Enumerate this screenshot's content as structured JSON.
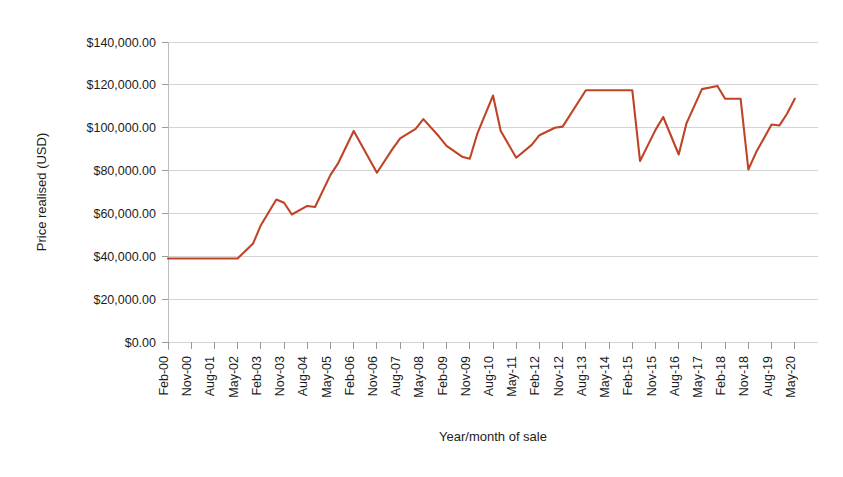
{
  "chart_data": {
    "type": "line",
    "title": "",
    "xlabel": "Year/month of sale",
    "ylabel": "Price realised (USD)",
    "ylim": [
      0,
      140000
    ],
    "ytick_values": [
      0,
      20000,
      40000,
      60000,
      80000,
      100000,
      120000,
      140000
    ],
    "ytick_labels": [
      "$0.00",
      "$20,000.00",
      "$40,000.00",
      "$60,000.00",
      "$80,000.00",
      "$100,000.00",
      "$120,000.00",
      "$140,000.00"
    ],
    "xtick_labels": [
      "Feb-00",
      "Nov-00",
      "Aug-01",
      "May-02",
      "Feb-03",
      "Nov-03",
      "Aug-04",
      "May-05",
      "Feb-06",
      "Nov-06",
      "Aug-07",
      "May-08",
      "Feb-09",
      "Nov-09",
      "Aug-10",
      "May-11",
      "Feb-12",
      "Nov-12",
      "Aug-13",
      "May-14",
      "Feb-15",
      "Nov-15",
      "Aug-16",
      "May-17",
      "Feb-18",
      "Nov-18",
      "Aug-19",
      "May-20"
    ],
    "xtick_interval_months": 9,
    "grid": true,
    "legend": "none",
    "line_color": "#bf4427",
    "series": [
      {
        "name": "Price realised",
        "x": [
          "Feb-00",
          "Nov-00",
          "Aug-01",
          "May-02",
          "Nov-02",
          "Feb-03",
          "Aug-03",
          "Nov-03",
          "Feb-04",
          "Aug-04",
          "Nov-04",
          "May-05",
          "Aug-05",
          "Feb-06",
          "Nov-06",
          "May-07",
          "Aug-07",
          "Feb-08",
          "May-08",
          "Nov-08",
          "Feb-09",
          "Aug-09",
          "Nov-09",
          "Feb-10",
          "Aug-10",
          "Nov-10",
          "May-11",
          "Nov-11",
          "Feb-12",
          "Aug-12",
          "Nov-12",
          "Aug-13",
          "Feb-15",
          "May-15",
          "Nov-15",
          "Feb-16",
          "Aug-16",
          "Nov-16",
          "May-17",
          "Nov-17",
          "Feb-18",
          "Aug-18",
          "Nov-18",
          "Feb-19",
          "Aug-19",
          "Nov-19",
          "Feb-20",
          "May-20"
        ],
        "values": [
          39000,
          39000,
          39000,
          39000,
          46000,
          54500,
          66500,
          65000,
          59500,
          63500,
          63000,
          78000,
          83500,
          98500,
          79000,
          90000,
          95000,
          99500,
          104000,
          96000,
          91500,
          86500,
          85500,
          97500,
          115000,
          98500,
          86000,
          92000,
          96500,
          100000,
          100500,
          117500,
          117500,
          84500,
          99000,
          105000,
          87500,
          102000,
          118000,
          119500,
          113500,
          113500,
          80500,
          88500,
          101500,
          101000,
          106500,
          113500
        ]
      }
    ]
  },
  "axis_geometry": {
    "plot_left": 168,
    "plot_right": 818,
    "plot_top": 42,
    "plot_bottom": 342
  }
}
